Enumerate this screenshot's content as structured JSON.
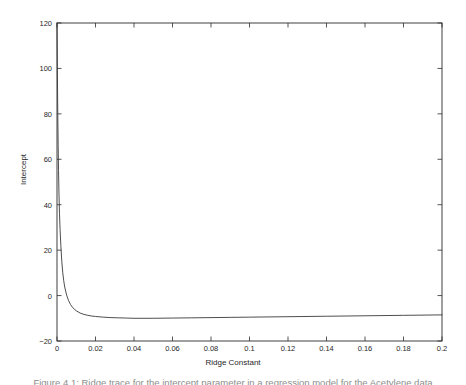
{
  "figure": {
    "background_color": "#ffffff",
    "axis_color": "#2b2b2b",
    "line_color": "#3a3a3a",
    "caption_partial": "Figure 4.1:  Ridge trace for the intercept parameter in a regression model for the Acetylene data"
  },
  "chart_data": {
    "type": "line",
    "title": "",
    "subtitle": "",
    "xlabel": "Ridge Constant",
    "ylabel": "Intercept",
    "xlim": [
      0,
      0.2
    ],
    "ylim": [
      -20,
      120
    ],
    "grid": false,
    "legend": null,
    "legend_position": "none",
    "xticks": [
      0,
      0.02,
      0.04,
      0.06,
      0.08,
      0.1,
      0.12,
      0.14,
      0.16,
      0.18,
      0.2
    ],
    "xtick_labels": [
      "0",
      "0.02",
      "0.04",
      "0.06",
      "0.08",
      "0.1",
      "0.12",
      "0.14",
      "0.16",
      "0.18",
      "0.2"
    ],
    "yticks": [
      -20,
      0,
      20,
      40,
      60,
      80,
      100,
      120
    ],
    "ytick_labels": [
      "-20",
      "0",
      "20",
      "40",
      "60",
      "80",
      "100",
      "120"
    ],
    "series": [
      {
        "name": "Intercept ridge trace",
        "color": "#3a3a3a",
        "x": [
          0.0,
          0.0002,
          0.0004,
          0.0006,
          0.0008,
          0.001,
          0.0013,
          0.0016,
          0.002,
          0.0025,
          0.003,
          0.0035,
          0.004,
          0.005,
          0.006,
          0.007,
          0.008,
          0.009,
          0.01,
          0.012,
          0.014,
          0.016,
          0.018,
          0.02,
          0.024,
          0.028,
          0.032,
          0.036,
          0.04,
          0.05,
          0.06,
          0.07,
          0.08,
          0.09,
          0.1,
          0.12,
          0.14,
          0.16,
          0.18,
          0.2
        ],
        "y": [
          120.0,
          98.0,
          80.0,
          66.0,
          55.0,
          46.0,
          36.0,
          29.0,
          22.0,
          15.0,
          10.0,
          6.5,
          3.8,
          0.2,
          -2.2,
          -3.9,
          -5.1,
          -6.0,
          -6.7,
          -7.7,
          -8.3,
          -8.7,
          -9.0,
          -9.2,
          -9.5,
          -9.7,
          -9.8,
          -9.9,
          -10.0,
          -10.0,
          -9.9,
          -9.8,
          -9.7,
          -9.6,
          -9.5,
          -9.3,
          -9.1,
          -8.9,
          -8.7,
          -8.5
        ]
      }
    ]
  },
  "axes_geometry": {
    "left_px": 57,
    "right_px": 442,
    "top_px": 23,
    "bottom_px": 341
  }
}
